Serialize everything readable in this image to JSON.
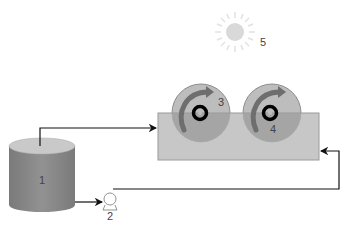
{
  "diagram": {
    "labels": {
      "tank": "1",
      "pump": "2",
      "disc_left": "3",
      "disc_right": "4",
      "sun": "5"
    },
    "components": [
      {
        "id": "1",
        "name": "reservoir-tank"
      },
      {
        "id": "2",
        "name": "pump"
      },
      {
        "id": "3",
        "name": "rotating-disc-left"
      },
      {
        "id": "4",
        "name": "rotating-disc-right"
      },
      {
        "id": "5",
        "name": "light-source-sun"
      }
    ],
    "connections": [
      {
        "from": "1",
        "to": "trough",
        "route": "tank top -> up -> right -> trough left side"
      },
      {
        "from": "1",
        "to": "2",
        "route": "tank bottom right -> pump"
      },
      {
        "from": "2",
        "to": "trough",
        "route": "pump -> right -> up -> trough right side"
      }
    ],
    "colors": {
      "tank_body": "#8a8a8a",
      "tank_top": "#c8c8c8",
      "trough": "#c4c4c4",
      "disc": "#b8b8b8",
      "arrow_rotation": "#6e6e6e",
      "sun": "#d8d8d8",
      "line": "#111111"
    }
  }
}
